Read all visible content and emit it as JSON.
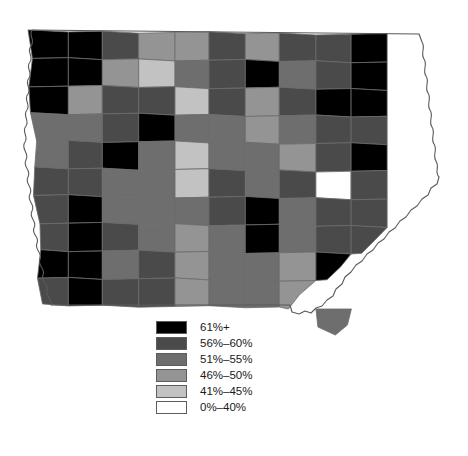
{
  "figure": {
    "width": 468,
    "height": 456
  },
  "legend": {
    "name": "map-legend",
    "entries": [
      {
        "label": "61%+",
        "color": "#000000",
        "min": 61,
        "max": 100
      },
      {
        "label": "56%–60%",
        "color": "#4a4a4a",
        "min": 56,
        "max": 60
      },
      {
        "label": "51%–55%",
        "color": "#6e6e6e",
        "min": 51,
        "max": 55
      },
      {
        "label": "46%–50%",
        "color": "#949494",
        "min": 46,
        "max": 50
      },
      {
        "label": "41%–45%",
        "color": "#c2c2c2",
        "min": 41,
        "max": 45
      },
      {
        "label": "0%–40%",
        "color": "#ffffff",
        "min": 0,
        "max": 40
      }
    ]
  },
  "chart_data": {
    "type": "heatmap",
    "subtitle": "",
    "xlabel": "",
    "ylabel": "",
    "grid": false,
    "legend_position": "bottom-center",
    "value_unit": "percent",
    "classes": [
      "0%–40%",
      "41%–45%",
      "46%–50%",
      "51%–55%",
      "56%–60%",
      "61%+"
    ],
    "class_colors": [
      "#ffffff",
      "#c2c2c2",
      "#949494",
      "#6e6e6e",
      "#4a4a4a",
      "#000000"
    ],
    "rows": [
      {
        "row": 1,
        "classes": [
          5,
          5,
          4,
          2,
          2,
          4,
          2,
          4,
          4,
          5,
          5
        ]
      },
      {
        "row": 2,
        "classes": [
          5,
          5,
          2,
          1,
          3,
          4,
          5,
          3,
          4,
          5,
          5
        ]
      },
      {
        "row": 3,
        "classes": [
          5,
          2,
          4,
          4,
          1,
          4,
          2,
          4,
          5,
          5,
          4
        ]
      },
      {
        "row": 4,
        "classes": [
          3,
          3,
          4,
          5,
          3,
          3,
          2,
          3,
          4,
          4,
          3
        ]
      },
      {
        "row": 5,
        "classes": [
          3,
          4,
          5,
          3,
          1,
          3,
          3,
          2,
          4,
          5,
          3
        ]
      },
      {
        "row": 6,
        "classes": [
          4,
          4,
          3,
          3,
          1,
          4,
          3,
          4,
          0,
          4,
          3
        ]
      },
      {
        "row": 7,
        "classes": [
          4,
          5,
          3,
          3,
          3,
          4,
          5,
          3,
          4,
          4,
          3
        ]
      },
      {
        "row": 8,
        "classes": [
          4,
          5,
          4,
          3,
          2,
          3,
          5,
          3,
          4,
          4,
          3
        ]
      },
      {
        "row": 9,
        "classes": [
          5,
          5,
          3,
          4,
          2,
          3,
          3,
          2,
          5,
          3,
          3
        ]
      },
      {
        "row": 10,
        "classes": [
          4,
          5,
          4,
          4,
          2,
          3,
          3,
          2,
          5,
          3,
          3
        ]
      }
    ],
    "highlighted_county": {
      "label": "61%+",
      "class_index": 0,
      "grid_row": 6,
      "grid_col": 9
    }
  }
}
